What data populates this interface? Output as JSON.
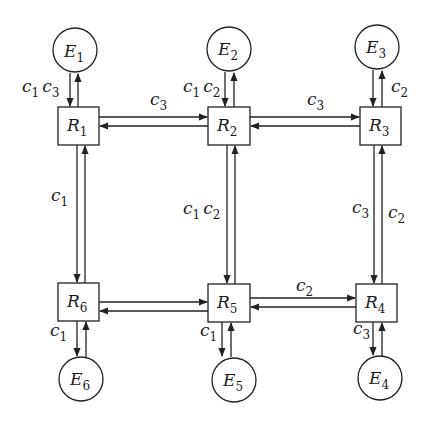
{
  "diagram": {
    "type": "network",
    "colors": {
      "stroke": "#222222",
      "background": "#ffffff"
    },
    "routers": [
      {
        "id": "R1",
        "base": "R",
        "sub": "1"
      },
      {
        "id": "R2",
        "base": "R",
        "sub": "2"
      },
      {
        "id": "R3",
        "base": "R",
        "sub": "3"
      },
      {
        "id": "R4",
        "base": "R",
        "sub": "4"
      },
      {
        "id": "R5",
        "base": "R",
        "sub": "5"
      },
      {
        "id": "R6",
        "base": "R",
        "sub": "6"
      }
    ],
    "endpoints": [
      {
        "id": "E1",
        "base": "E",
        "sub": "1"
      },
      {
        "id": "E2",
        "base": "E",
        "sub": "2"
      },
      {
        "id": "E3",
        "base": "E",
        "sub": "3"
      },
      {
        "id": "E4",
        "base": "E",
        "sub": "4"
      },
      {
        "id": "E5",
        "base": "E",
        "sub": "5"
      },
      {
        "id": "E6",
        "base": "E",
        "sub": "6"
      }
    ],
    "edges": [
      {
        "from": "E1",
        "to": "R1",
        "bidirectional": true,
        "labels": [
          {
            "base": "c",
            "sub": "1"
          },
          {
            "base": "c",
            "sub": "3"
          }
        ]
      },
      {
        "from": "E2",
        "to": "R2",
        "bidirectional": true,
        "labels": [
          {
            "base": "c",
            "sub": "1"
          },
          {
            "base": "c",
            "sub": "2"
          }
        ]
      },
      {
        "from": "E3",
        "to": "R3",
        "bidirectional": true,
        "labels": [
          {
            "base": "c",
            "sub": "2"
          }
        ]
      },
      {
        "from": "R1",
        "to": "R2",
        "bidirectional": true,
        "labels": [
          {
            "base": "c",
            "sub": "3"
          }
        ]
      },
      {
        "from": "R2",
        "to": "R3",
        "bidirectional": true,
        "labels": [
          {
            "base": "c",
            "sub": "3"
          }
        ]
      },
      {
        "from": "R1",
        "to": "R6",
        "bidirectional": true,
        "labels": [
          {
            "base": "c",
            "sub": "1"
          }
        ]
      },
      {
        "from": "R2",
        "to": "R5",
        "bidirectional": true,
        "labels": [
          {
            "base": "c",
            "sub": "1"
          },
          {
            "base": "c",
            "sub": "2"
          }
        ]
      },
      {
        "from": "R3",
        "to": "R4",
        "bidirectional": true,
        "labels": [
          {
            "base": "c",
            "sub": "3"
          },
          {
            "base": "c",
            "sub": "2"
          }
        ]
      },
      {
        "from": "R6",
        "to": "R5",
        "bidirectional": true,
        "labels": []
      },
      {
        "from": "R5",
        "to": "R4",
        "bidirectional": true,
        "labels": [
          {
            "base": "c",
            "sub": "2"
          }
        ]
      },
      {
        "from": "R6",
        "to": "E6",
        "bidirectional": true,
        "labels": [
          {
            "base": "c",
            "sub": "1"
          }
        ]
      },
      {
        "from": "R5",
        "to": "E5",
        "bidirectional": true,
        "labels": [
          {
            "base": "c",
            "sub": "1"
          }
        ]
      },
      {
        "from": "R4",
        "to": "E4",
        "bidirectional": true,
        "labels": [
          {
            "base": "c",
            "sub": "3"
          }
        ]
      }
    ]
  }
}
